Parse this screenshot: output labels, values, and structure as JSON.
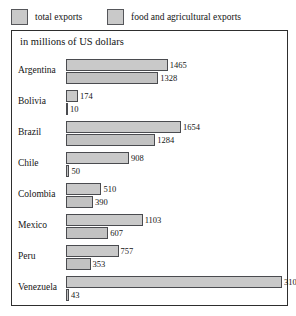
{
  "legend": {
    "items": [
      {
        "label": "total exports",
        "swatch": "legend-swatch-total",
        "color": "#c9c9c9"
      },
      {
        "label": "food and agricultural exports",
        "swatch": "legend-swatch-food",
        "color": "#c9c9c9"
      }
    ]
  },
  "chart_data": {
    "type": "bar",
    "orientation": "horizontal",
    "title": "",
    "subtitle": "in millions of US dollars",
    "xlabel": "",
    "ylabel": "",
    "xlim": [
      0,
      3108
    ],
    "grid": false,
    "legend_position": "above-top-left",
    "categories": [
      "Argentina",
      "Bolivia",
      "Brazil",
      "Chile",
      "Colombia",
      "Mexico",
      "Peru",
      "Venezuela"
    ],
    "series": [
      {
        "name": "total exports",
        "color": "#c9c9c9",
        "values": [
          1465,
          174,
          1654,
          908,
          510,
          1103,
          757,
          3108
        ]
      },
      {
        "name": "food and agricultural exports",
        "color": "#c9c9c9",
        "values": [
          1328,
          10,
          1284,
          50,
          390,
          607,
          353,
          43
        ]
      }
    ]
  }
}
